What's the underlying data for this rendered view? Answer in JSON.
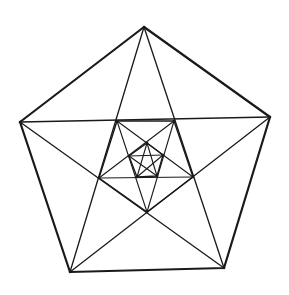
{
  "diagram": {
    "stroke_color": "#1a1a1a",
    "background": "#ffffff",
    "levels": [
      {
        "name": "outer-pentagon",
        "vertices": [
          [
            144,
            27
          ],
          [
            270,
            117
          ],
          [
            224,
            268
          ],
          [
            70,
            272
          ],
          [
            20,
            122
          ]
        ],
        "stroke_width": 2.2,
        "draw_polygon": true,
        "draw_star": true
      },
      {
        "name": "second-pentagon",
        "vertices": [
          [
            117,
            121
          ],
          [
            174,
            121
          ],
          [
            193,
            177
          ],
          [
            147,
            212
          ],
          [
            99,
            178
          ]
        ],
        "stroke_width": 1.4,
        "draw_polygon": true,
        "draw_star": true
      },
      {
        "name": "third-pentagon",
        "vertices": [
          [
            147,
            143
          ],
          [
            163,
            155
          ],
          [
            157,
            176
          ],
          [
            137,
            177
          ],
          [
            129,
            156
          ]
        ],
        "stroke_width": 1.3,
        "draw_polygon": true,
        "draw_star": true
      }
    ]
  }
}
